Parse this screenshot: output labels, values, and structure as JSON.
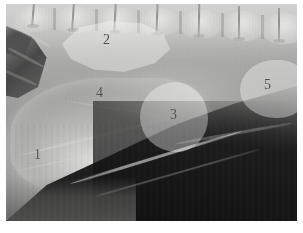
{
  "figure": {
    "type": "radiograph",
    "modality": "x-ray",
    "view": "lateral abdomen",
    "background_color": "#ffffff",
    "plate_color": "#8e8e8e",
    "label_color": "#4c4c4c",
    "highlight_color": "#ffffff",
    "highlight_opacity": "0.36"
  },
  "regions": [
    {
      "number": "1",
      "name": "region-1",
      "label_x": 34,
      "label_y": 148,
      "highlighted": false
    },
    {
      "number": "2",
      "name": "region-2",
      "label_x": 103,
      "label_y": 33,
      "highlighted": true
    },
    {
      "number": "3",
      "name": "region-3",
      "label_x": 170,
      "label_y": 108,
      "highlighted": true
    },
    {
      "number": "4",
      "name": "region-4",
      "label_x": 96,
      "label_y": 86,
      "highlighted": false
    },
    {
      "number": "5",
      "name": "region-5",
      "label_x": 264,
      "label_y": 78,
      "highlighted": true
    }
  ],
  "anatomy": {
    "spine_label": "lumbar-vertebrae",
    "vertebra_count": 7,
    "lung_wedge_label": "gas-lucency-cranial",
    "dark_field_label": "gas-filled-lucent-field",
    "flank_label": "body-wall-contour"
  }
}
